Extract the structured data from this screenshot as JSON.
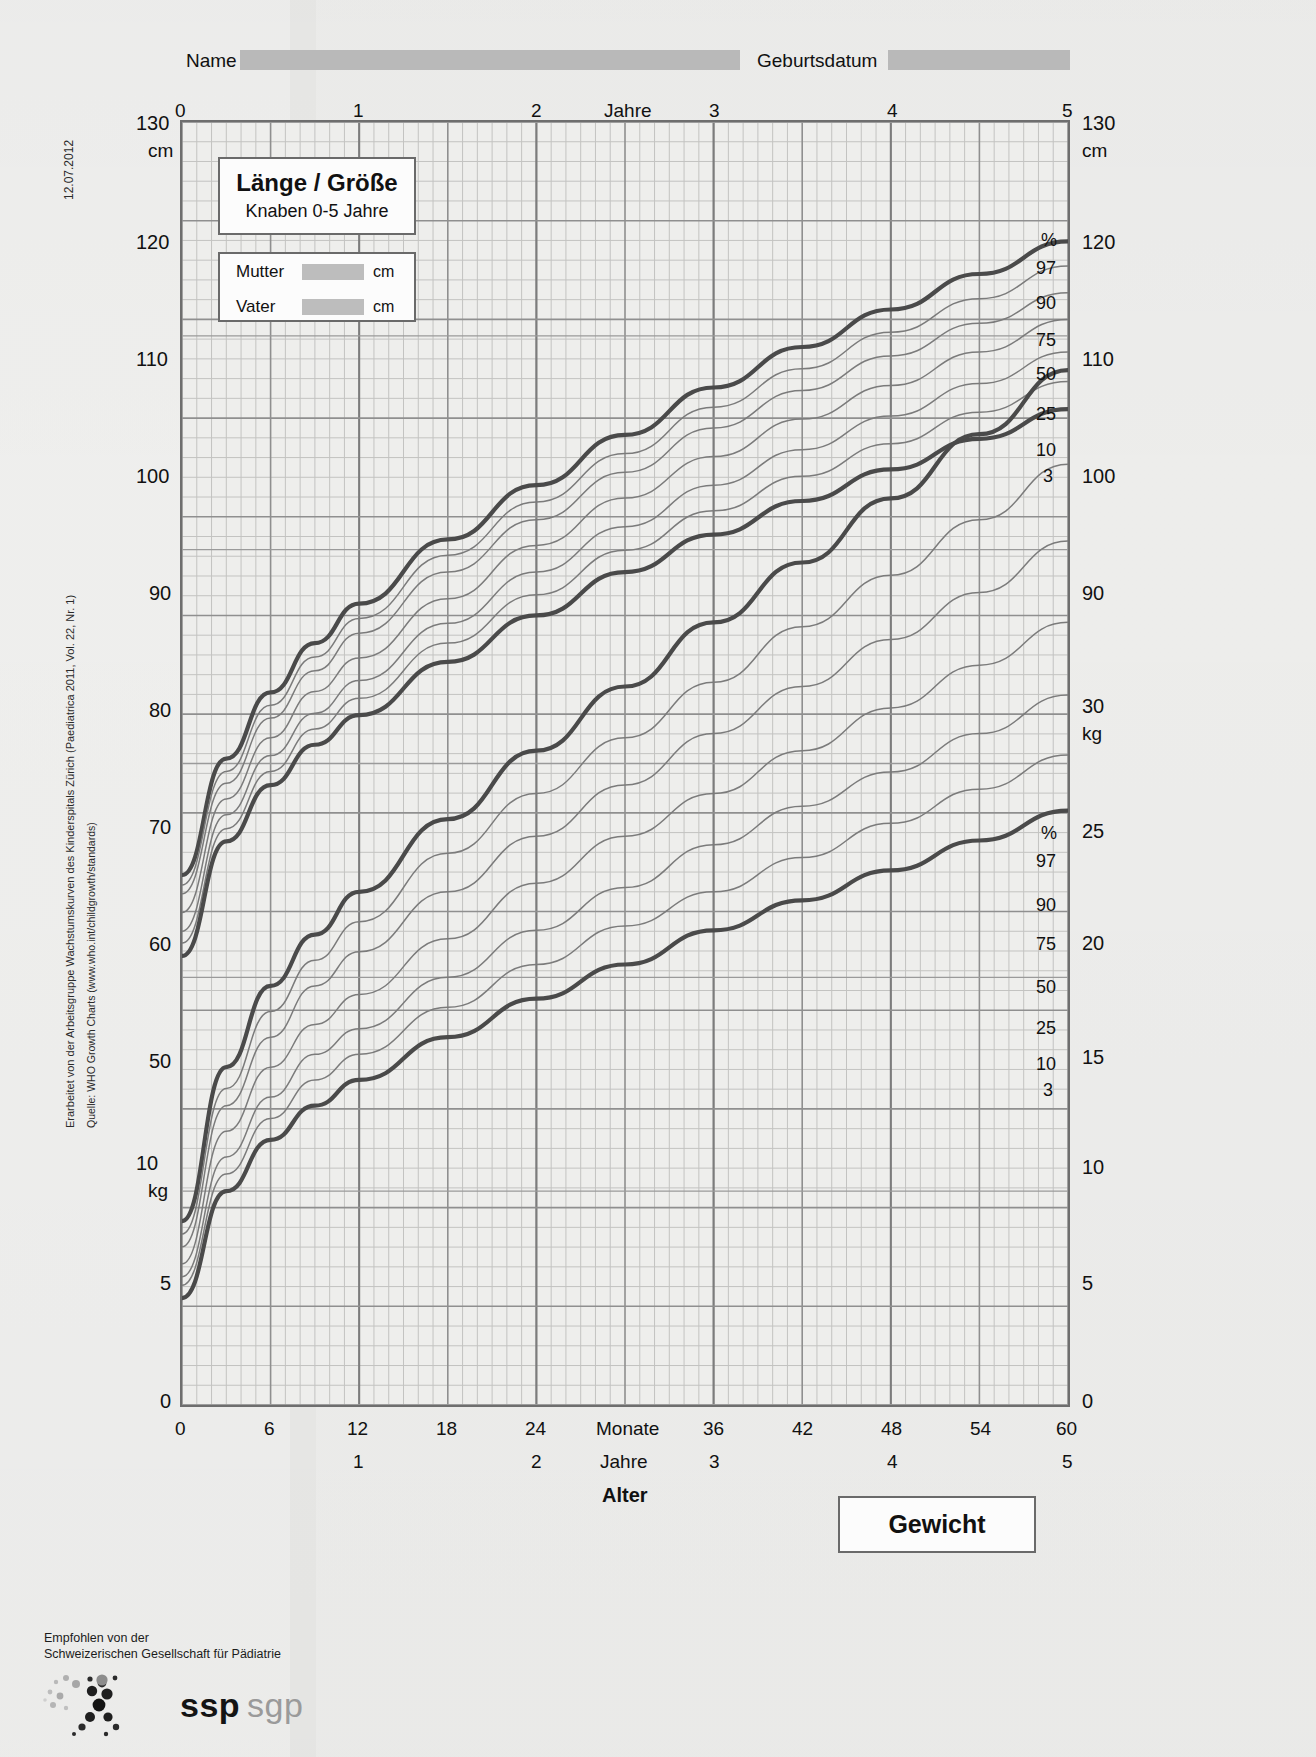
{
  "header": {
    "name_label": "Name",
    "birthdate_label": "Geburtsdatum",
    "name_value": "",
    "birthdate_value": ""
  },
  "side": {
    "date": "12.07.2012",
    "credit": "Erarbeitet von der Arbeitsgruppe Wachstumskurven des Kinderspitals Zürich (Paediatrica 2011, Vol. 22, Nr. 1)",
    "source": "Quelle: WHO Growth Charts (www.who.int/childgrowth/standards)"
  },
  "title_box": {
    "title": "Länge / Größe",
    "subtitle": "Knaben 0-5 Jahre"
  },
  "parent_box": {
    "mother_label": "Mutter",
    "mother_value": "",
    "father_label": "Vater",
    "father_value": "",
    "unit": "cm"
  },
  "weight_box": {
    "label": "Gewicht"
  },
  "axes": {
    "top_label": "Jahre",
    "top_ticks": [
      "0",
      "1",
      "2",
      "3",
      "4",
      "5"
    ],
    "left_height_unit": "cm",
    "left_height_ticks": [
      "130",
      "120",
      "110",
      "100",
      "90",
      "80",
      "70",
      "60",
      "50"
    ],
    "right_height_ticks": [
      "130",
      "120",
      "110",
      "100",
      "90"
    ],
    "right_height_unit": "cm",
    "left_weight_unit": "kg",
    "left_weight_ticks": [
      "10",
      "5",
      "0"
    ],
    "right_weight_unit": "kg",
    "right_weight_ticks": [
      "30",
      "25",
      "20",
      "15",
      "10",
      "5",
      "0"
    ],
    "bottom_months_label": "Monate",
    "bottom_months_ticks": [
      "0",
      "6",
      "12",
      "18",
      "24",
      "36",
      "42",
      "48",
      "54",
      "60"
    ],
    "bottom_years_label": "Jahre",
    "bottom_years_ticks": [
      "1",
      "2",
      "3",
      "4",
      "5"
    ],
    "bottom_title": "Alter"
  },
  "percentiles": {
    "symbol": "%",
    "labels": [
      "97",
      "90",
      "75",
      "50",
      "25",
      "10",
      "3"
    ]
  },
  "footer": {
    "line1": "Empfohlen von der",
    "line2": "Schweizerischen Gesellschaft für Pädiatrie",
    "logo_a": "ssp",
    "logo_b": "sgp"
  },
  "colors": {
    "outer_curve": "#4a4a4a",
    "inner_curve": "#7b7b7b",
    "grid_major": "#8e8e8e",
    "grid_minor": "#bdbdbd",
    "fill_field": "#bdbdbd",
    "paper": "#e9e9e7",
    "plot_bg": "#eeeeec"
  },
  "chart_data": {
    "type": "line",
    "xlabel": "Alter",
    "x_unit_primary": "Monate",
    "x_unit_secondary": "Jahre",
    "xlim": [
      0,
      60
    ],
    "x_ticks_months": [
      0,
      6,
      12,
      18,
      24,
      30,
      36,
      42,
      48,
      54,
      60
    ],
    "grid": true,
    "legend": "right-edge percentile labels",
    "panels": [
      {
        "name": "length-height",
        "ylabel": "cm",
        "ylim": [
          0,
          130
        ],
        "y_ticks": [
          50,
          60,
          70,
          80,
          90,
          100,
          110,
          120,
          130
        ],
        "x": [
          0,
          3,
          6,
          9,
          12,
          18,
          24,
          30,
          36,
          42,
          48,
          54,
          60
        ],
        "series": [
          {
            "name": "97",
            "values": [
              53.7,
              65.5,
              72.2,
              77.2,
              81.2,
              87.7,
              93.2,
              98.3,
              103.1,
              107.2,
              111.0,
              114.6,
              117.9
            ]
          },
          {
            "name": "90",
            "values": [
              52.7,
              64.2,
              70.9,
              75.8,
              79.7,
              86.1,
              91.5,
              96.4,
              101.1,
              105.0,
              108.7,
              112.1,
              115.4
            ]
          },
          {
            "name": "75",
            "values": [
              51.8,
              63.0,
              69.6,
              74.4,
              78.2,
              84.4,
              89.7,
              94.5,
              99.0,
              102.8,
              106.3,
              109.6,
              112.7
            ]
          },
          {
            "name": "50",
            "values": [
              49.9,
              61.4,
              67.6,
              72.3,
              75.7,
              81.7,
              87.1,
              91.9,
              96.1,
              99.9,
              103.3,
              106.7,
              110.0
            ]
          },
          {
            "name": "25",
            "values": [
              48.0,
              59.8,
              65.8,
              70.1,
              73.4,
              79.2,
              84.4,
              89.0,
              93.2,
              96.8,
              100.2,
              103.5,
              106.7
            ]
          },
          {
            "name": "10",
            "values": [
              46.8,
              58.4,
              64.2,
              68.5,
              71.6,
              77.2,
              82.1,
              86.6,
              90.6,
              94.1,
              97.4,
              100.6,
              103.7
            ]
          },
          {
            "name": "3",
            "values": [
              45.5,
              57.1,
              62.8,
              66.9,
              69.9,
              75.3,
              80.0,
              84.4,
              88.2,
              91.6,
              94.8,
              97.9,
              100.9
            ]
          }
        ]
      },
      {
        "name": "weight",
        "ylabel": "kg",
        "ylim": [
          0,
          30
        ],
        "y_ticks": [
          5,
          10,
          15,
          20,
          25,
          30
        ],
        "x": [
          0,
          3,
          6,
          9,
          12,
          18,
          24,
          30,
          36,
          42,
          48,
          54,
          60
        ],
        "series": [
          {
            "name": "97",
            "values": [
              4.3,
              7.9,
              9.8,
              11.0,
              12.0,
              13.7,
              15.3,
              16.8,
              18.3,
              19.7,
              21.2,
              22.7,
              24.2
            ]
          },
          {
            "name": "90",
            "values": [
              4.0,
              7.4,
              9.2,
              10.4,
              11.3,
              12.9,
              14.3,
              15.6,
              16.9,
              18.2,
              19.4,
              20.7,
              22.0
            ]
          },
          {
            "name": "75",
            "values": [
              3.7,
              7.0,
              8.6,
              9.8,
              10.6,
              12.0,
              13.3,
              14.5,
              15.7,
              16.8,
              17.9,
              19.0,
              20.2
            ]
          },
          {
            "name": "50",
            "values": [
              3.3,
              6.4,
              7.9,
              8.9,
              9.6,
              10.9,
              12.2,
              13.3,
              14.3,
              15.3,
              16.3,
              17.3,
              18.3
            ]
          },
          {
            "name": "25",
            "values": [
              3.0,
              5.8,
              7.2,
              8.2,
              8.8,
              10.0,
              11.1,
              12.1,
              13.1,
              14.0,
              14.8,
              15.7,
              16.6
            ]
          },
          {
            "name": "10",
            "values": [
              2.8,
              5.4,
              6.7,
              7.6,
              8.2,
              9.3,
              10.3,
              11.2,
              12.0,
              12.8,
              13.6,
              14.4,
              15.2
            ]
          },
          {
            "name": "3",
            "values": [
              2.5,
              5.0,
              6.2,
              7.0,
              7.6,
              8.6,
              9.5,
              10.3,
              11.1,
              11.8,
              12.5,
              13.2,
              13.9
            ]
          }
        ]
      }
    ]
  }
}
